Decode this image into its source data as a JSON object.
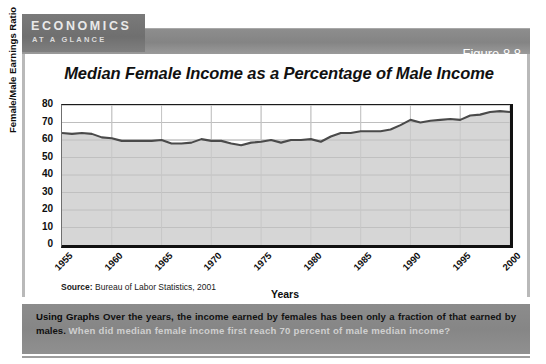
{
  "banner": {
    "brand_line1": "ECONOMICS",
    "brand_line2": "AT A GLANCE",
    "figure_label": "Figure 8.8"
  },
  "chart_panel": {
    "title": "Median Female Income as a Percentage of Male Income",
    "source": "Bureau of Labor Statistics, 2001",
    "source_prefix": "Source:"
  },
  "caption": {
    "lead": "Using Graphs",
    "body": "Over the years, the income earned by females has been only a fraction of that earned by males.",
    "question": "When did median female income first reach 70 percent of male median income?"
  },
  "chart_data": {
    "type": "area",
    "title": "Median Female Income as a Percentage of Male Income",
    "xlabel": "Years",
    "ylabel": "Female/Male Earnings Ratio",
    "xlim": [
      1955,
      2000
    ],
    "ylim": [
      0,
      80
    ],
    "yticks": [
      0,
      10,
      20,
      30,
      40,
      50,
      60,
      70,
      80
    ],
    "xticks": [
      1955,
      1960,
      1965,
      1970,
      1975,
      1980,
      1985,
      1990,
      1995,
      2000
    ],
    "grid": true,
    "legend": "none",
    "line_color": "#4a4a4a",
    "fill_color": "#d6d6d6",
    "x": [
      1955,
      1956,
      1957,
      1958,
      1959,
      1960,
      1961,
      1962,
      1963,
      1964,
      1965,
      1966,
      1967,
      1968,
      1969,
      1970,
      1971,
      1972,
      1973,
      1974,
      1975,
      1976,
      1977,
      1978,
      1979,
      1980,
      1981,
      1982,
      1983,
      1984,
      1985,
      1986,
      1987,
      1988,
      1989,
      1990,
      1991,
      1992,
      1993,
      1994,
      1995,
      1996,
      1997,
      1998,
      1999,
      2000
    ],
    "values": [
      64,
      63.5,
      64,
      63.5,
      61.5,
      61,
      59.5,
      59.5,
      59.5,
      59.5,
      60,
      58,
      58,
      58.5,
      60.5,
      59.5,
      59.5,
      58,
      57,
      58.5,
      59,
      60,
      58.5,
      60,
      60,
      60.5,
      59,
      62,
      64,
      64,
      65,
      65,
      65,
      66,
      68.5,
      71.5,
      70,
      71,
      71.5,
      72,
      71.5,
      74,
      74.5,
      76,
      76.5,
      76
    ]
  }
}
